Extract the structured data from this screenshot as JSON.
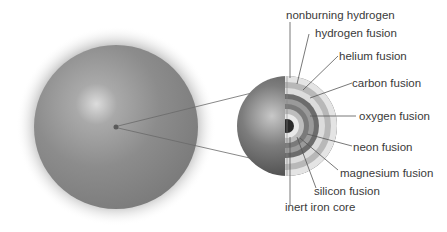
{
  "diagram": {
    "title": "",
    "star": {
      "label": ""
    },
    "layers": [
      {
        "label": "nonburning hydrogen"
      },
      {
        "label": "hydrogen fusion"
      },
      {
        "label": "helium fusion"
      },
      {
        "label": "carbon fusion"
      },
      {
        "label": "oxygen fusion"
      },
      {
        "label": "neon fusion"
      },
      {
        "label": "magnesium fusion"
      },
      {
        "label": "silicon fusion"
      },
      {
        "label": "inert iron core"
      }
    ],
    "colors": {
      "star_body": "#8a8a8a",
      "star_highlight": "#d8d8d8",
      "leader_line": "#555555",
      "text": "#3a3a3a"
    }
  }
}
